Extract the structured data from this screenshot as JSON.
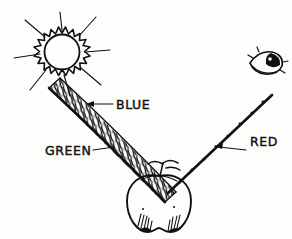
{
  "figure": {
    "background_color": "#fdfdfc",
    "ink_color": "#12100f",
    "width": 292,
    "height": 239
  },
  "objects": {
    "sun": {
      "name": "sun",
      "center_x": 62,
      "center_y": 52,
      "core_radius": 18,
      "spike_count": 14,
      "ray_count": 8
    },
    "eye": {
      "name": "observer-eye",
      "center_x": 266,
      "center_y": 62
    },
    "apple": {
      "name": "apple",
      "center_x": 159,
      "center_y": 200
    }
  },
  "beams": {
    "incident": {
      "name": "incident-white-light-beam",
      "style": "hatched-band",
      "from_x": 52,
      "from_y": 93,
      "to_x": 166,
      "to_y": 196
    },
    "reflected": {
      "name": "reflected-red-beam",
      "style": "solid-line",
      "from_x": 166,
      "from_y": 190,
      "to_x": 270,
      "to_y": 96
    }
  },
  "labels": [
    {
      "id": "blue",
      "text": "BLUE",
      "x": 116,
      "y": 109,
      "leader_from_x": 113,
      "leader_from_y": 104,
      "leader_to_x": 88,
      "leader_to_y": 104,
      "arrow": "left"
    },
    {
      "id": "green",
      "text": "GREEN",
      "x": 45,
      "y": 155,
      "leader_from_x": 92,
      "leader_from_y": 150,
      "leader_to_x": 110,
      "leader_to_y": 148,
      "arrow": "none"
    },
    {
      "id": "red",
      "text": "RED",
      "x": 250,
      "y": 146,
      "leader_from_x": 247,
      "leader_from_y": 150,
      "leader_to_x": 216,
      "leader_to_y": 146,
      "arrow": "left"
    }
  ],
  "colors": {
    "ink": "#12100f",
    "paper": "#fdfdfc"
  }
}
